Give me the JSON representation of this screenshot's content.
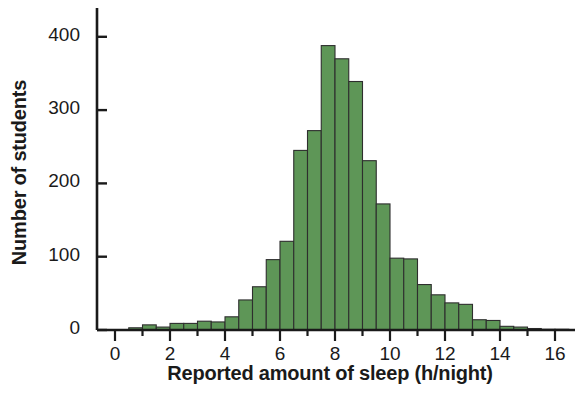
{
  "chart_data": {
    "type": "bar",
    "title": "",
    "subtitle": "",
    "xlabel": "Reported amount of sleep (h/night)",
    "ylabel": "Number of students",
    "xlim": [
      0,
      16.5
    ],
    "ylim": [
      0,
      420
    ],
    "xticks": [
      0,
      2,
      4,
      6,
      8,
      10,
      12,
      14,
      16
    ],
    "xtick_labels": [
      "0",
      "2",
      "4",
      "6",
      "8",
      "10",
      "12",
      "14",
      "16"
    ],
    "x_minor_tick_step": 1,
    "yticks": [
      0,
      100,
      200,
      300,
      400
    ],
    "ytick_labels": [
      "0",
      "100",
      "200",
      "300",
      "400"
    ],
    "grid": false,
    "legend": null,
    "bin_width": 0.5,
    "bar_fill_color": "#5E9657",
    "bar_edge_color": "#2e2e2e",
    "axis_color": "#1a1a1a",
    "background_color": "#ffffff",
    "categories": [
      "0.0-0.5",
      "0.5-1.0",
      "1.0-1.5",
      "1.5-2.0",
      "2.0-2.5",
      "2.5-3.0",
      "3.0-3.5",
      "3.5-4.0",
      "4.0-4.5",
      "4.5-5.0",
      "5.0-5.5",
      "5.5-6.0",
      "6.0-6.5",
      "6.5-7.0",
      "7.0-7.5",
      "7.5-8.0",
      "8.0-8.5",
      "8.5-9.0",
      "9.0-9.5",
      "9.5-10.0",
      "10.0-10.5",
      "10.5-11.0",
      "11.0-11.5",
      "11.5-12.0",
      "12.0-12.5",
      "12.5-13.0",
      "13.0-13.5",
      "13.5-14.0",
      "14.0-14.5",
      "14.5-15.0",
      "15.0-15.5",
      "15.5-16.0",
      "16.0-16.5"
    ],
    "bin_starts": [
      0.0,
      0.5,
      1.0,
      1.5,
      2.0,
      2.5,
      3.0,
      3.5,
      4.0,
      4.5,
      5.0,
      5.5,
      6.0,
      6.5,
      7.0,
      7.5,
      8.0,
      8.5,
      9.0,
      9.5,
      10.0,
      10.5,
      11.0,
      11.5,
      12.0,
      12.5,
      13.0,
      13.5,
      14.0,
      14.5,
      15.0,
      15.5,
      16.0
    ],
    "values": [
      0,
      3,
      7,
      4,
      9,
      9,
      12,
      11,
      18,
      41,
      59,
      96,
      121,
      245,
      272,
      388,
      370,
      339,
      231,
      172,
      98,
      97,
      62,
      48,
      37,
      35,
      14,
      13,
      5,
      4,
      2,
      1,
      1
    ]
  }
}
